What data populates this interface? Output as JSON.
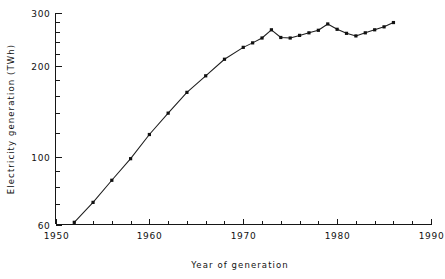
{
  "chart_data": {
    "type": "line",
    "title": "",
    "xlabel": "Year of generation",
    "ylabel": "Electricity generation (TWh)",
    "xlim": [
      1950,
      1990
    ],
    "ylim": [
      60,
      300
    ],
    "yscale": "log",
    "xscale": "linear",
    "grid": false,
    "legend": null,
    "x_major_ticks": [
      1950,
      1960,
      1970,
      1980,
      1990
    ],
    "x_major_tick_labels": [
      "1950",
      "1960",
      "1970",
      "1980",
      "1990"
    ],
    "x_minor_tick_step": 2,
    "y_major_ticks": [
      60,
      100,
      200,
      300
    ],
    "y_major_tick_labels": [
      "60",
      "100",
      "200",
      "300"
    ],
    "y_minor_ticks": [
      70,
      80,
      90,
      120,
      140,
      160,
      180,
      220,
      240,
      260,
      280
    ],
    "marker": "square",
    "x": [
      1952,
      1954,
      1956,
      1958,
      1960,
      1962,
      1964,
      1966,
      1968,
      1970,
      1971,
      1972,
      1973,
      1974,
      1975,
      1976,
      1977,
      1978,
      1979,
      1980,
      1981,
      1982,
      1983,
      1984,
      1985,
      1986
    ],
    "values": [
      61,
      71,
      84,
      99,
      119,
      140,
      164,
      186,
      211,
      231,
      239,
      248,
      264,
      249,
      248,
      253,
      258,
      263,
      276,
      265,
      257,
      252,
      258,
      264,
      270,
      279
    ],
    "series": [
      {
        "name": "Electricity generation",
        "values": [
          61,
          71,
          84,
          99,
          119,
          140,
          164,
          186,
          211,
          231,
          239,
          248,
          264,
          249,
          248,
          253,
          258,
          263,
          276,
          265,
          257,
          252,
          258,
          264,
          270,
          279
        ]
      }
    ]
  },
  "axes": {
    "y_title": "Electricity generation (TWh)",
    "x_title": "Year of generation"
  }
}
